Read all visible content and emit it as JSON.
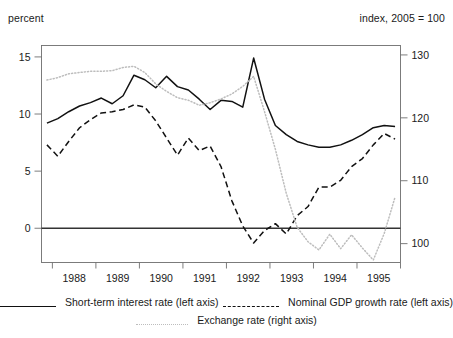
{
  "header": {
    "left_unit": "percent",
    "right_unit": "index, 2005 = 100"
  },
  "legend": {
    "items": [
      {
        "label": "Short-term interest  rate (left axis)",
        "style": "solid",
        "color": "#111111"
      },
      {
        "label": "Nominal GDP growth rate  (left axis)",
        "style": "dashed",
        "color": "#111111"
      },
      {
        "label": "Exchange rate (right axis)",
        "style": "dotted",
        "color": "#bdbdbd"
      }
    ]
  },
  "chart_data": {
    "type": "line",
    "title": "",
    "xlabel": "",
    "ylabel": "percent",
    "y2label": "index, 2005 = 100",
    "ylim": [
      -3.0,
      16.0
    ],
    "y2lim": [
      97.0,
      131.5
    ],
    "yticks": [
      0,
      5,
      10,
      15
    ],
    "y2ticks": [
      100,
      110,
      120,
      130
    ],
    "xlim": [
      1987.75,
      1996.0
    ],
    "xticks": [
      1988,
      1989,
      1990,
      1991,
      1992,
      1993,
      1994,
      1995,
      1996
    ],
    "tick_labels": [
      "1988",
      "1989",
      "1990",
      "1991",
      "1992",
      "1993",
      "1994",
      "1995"
    ],
    "grid": false,
    "zero_line": 0,
    "legend_position": "bottom",
    "x": [
      1987.875,
      1988.125,
      1988.375,
      1988.625,
      1988.875,
      1989.125,
      1989.375,
      1989.625,
      1989.875,
      1990.125,
      1990.375,
      1990.625,
      1990.875,
      1991.125,
      1991.375,
      1991.625,
      1991.875,
      1992.125,
      1992.375,
      1992.625,
      1992.875,
      1993.125,
      1993.375,
      1993.625,
      1993.875,
      1994.125,
      1994.375,
      1994.625,
      1994.875,
      1995.125,
      1995.375,
      1995.625,
      1995.875
    ],
    "series": [
      {
        "name": "Short-term interest rate (left axis)",
        "axis": "left",
        "style": "solid",
        "color": "#111111",
        "values": [
          9.2,
          9.6,
          10.2,
          10.7,
          11.0,
          11.4,
          10.9,
          11.6,
          13.4,
          13.0,
          12.3,
          13.3,
          12.4,
          12.1,
          11.3,
          10.4,
          11.2,
          11.1,
          10.6,
          14.9,
          11.3,
          9.0,
          8.2,
          7.6,
          7.3,
          7.1,
          7.1,
          7.3,
          7.7,
          8.2,
          8.8,
          9.0,
          8.9
        ]
      },
      {
        "name": "Nominal GDP growth rate (left axis)",
        "axis": "left",
        "style": "dashed",
        "color": "#111111",
        "values": [
          7.3,
          6.3,
          7.6,
          8.8,
          9.5,
          10.1,
          10.2,
          10.4,
          10.8,
          10.6,
          9.4,
          7.9,
          6.4,
          7.9,
          6.8,
          7.2,
          5.4,
          2.4,
          0.2,
          -1.3,
          -0.2,
          0.4,
          -0.5,
          1.1,
          1.9,
          3.6,
          3.6,
          4.2,
          5.4,
          6.1,
          7.3,
          8.3,
          7.8
        ]
      },
      {
        "name": "Exchange rate (right axis)",
        "axis": "right",
        "style": "dotted",
        "color": "#bdbdbd",
        "values": [
          126.0,
          126.4,
          127.0,
          127.2,
          127.4,
          127.4,
          127.5,
          128.0,
          128.2,
          127.2,
          125.4,
          124.2,
          123.2,
          122.8,
          122.0,
          122.4,
          123.0,
          123.8,
          125.0,
          126.6,
          121.0,
          115.0,
          108.0,
          102.6,
          100.3,
          99.0,
          101.5,
          99.2,
          101.4,
          99.3,
          97.4,
          101.6,
          107.4
        ]
      }
    ]
  }
}
